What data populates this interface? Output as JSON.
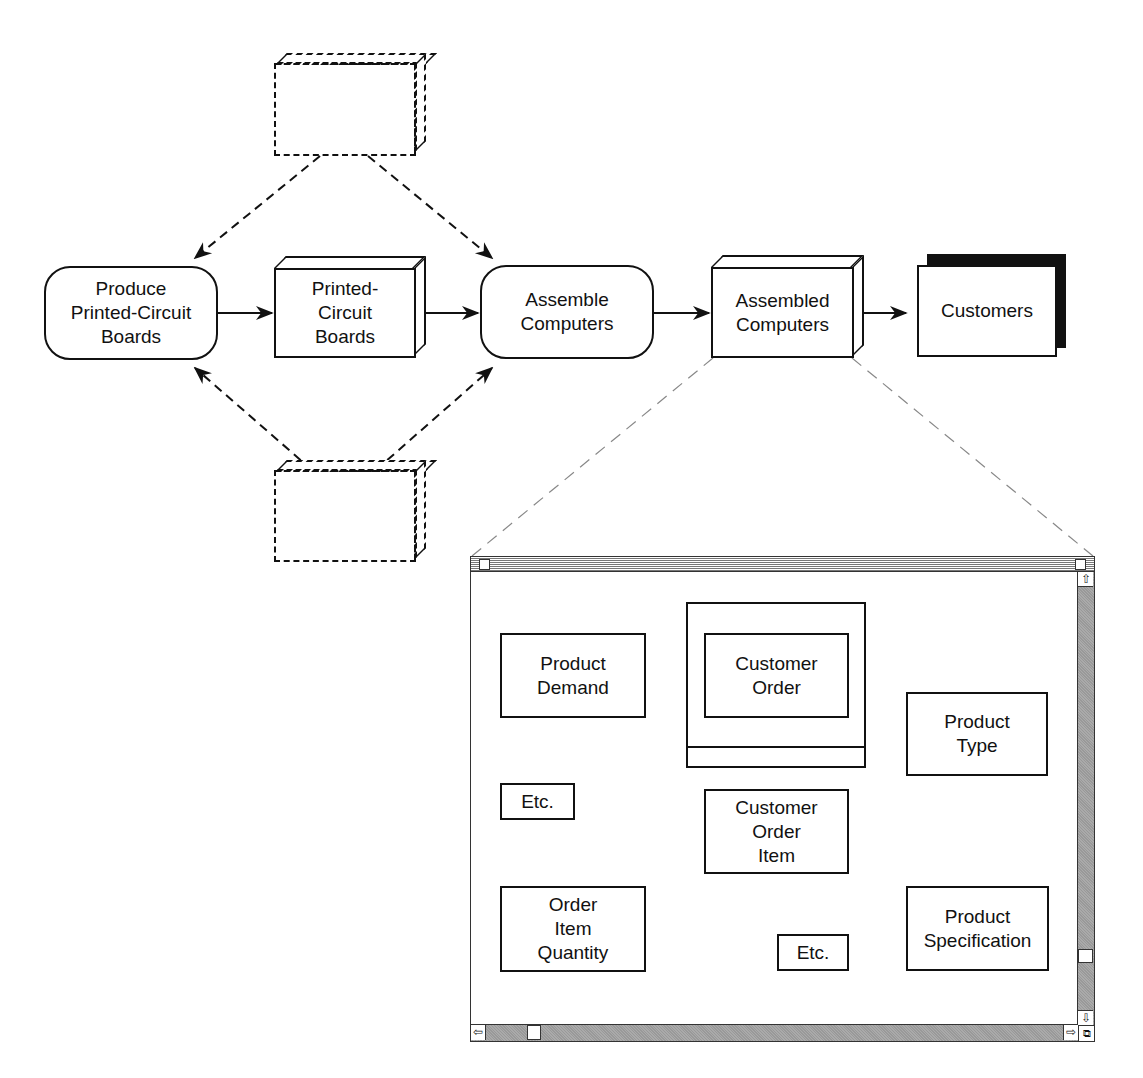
{
  "process_flow": {
    "processes": [
      {
        "id": "produce-pcb",
        "label": "Produce\nPrinted-Circuit\nBoards"
      },
      {
        "id": "assemble-computers",
        "label": "Assemble\nComputers"
      }
    ],
    "stores": [
      {
        "id": "pcb-store",
        "label": "Printed-\nCircuit\nBoards"
      },
      {
        "id": "assembled-store",
        "label": "Assembled\nComputers"
      },
      {
        "id": "top-dashed-store",
        "label": ""
      },
      {
        "id": "bottom-dashed-store",
        "label": ""
      }
    ],
    "external": {
      "id": "customers",
      "label": "Customers"
    }
  },
  "zoom_window": {
    "entities": [
      {
        "id": "product-demand",
        "label": "Product\nDemand"
      },
      {
        "id": "customer-order",
        "label": "Customer\nOrder"
      },
      {
        "id": "product-type",
        "label": "Product\nType"
      },
      {
        "id": "etc-1",
        "label": "Etc."
      },
      {
        "id": "customer-order-item",
        "label": "Customer\nOrder\nItem"
      },
      {
        "id": "order-item-quantity",
        "label": "Order\nItem\nQuantity"
      },
      {
        "id": "etc-2",
        "label": "Etc."
      },
      {
        "id": "product-specification",
        "label": "Product\nSpecification"
      }
    ],
    "scroll": {
      "up": "⇧",
      "down": "⇩",
      "left": "⇦",
      "right": "⇨"
    }
  }
}
